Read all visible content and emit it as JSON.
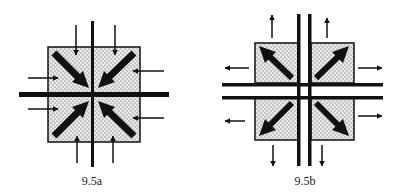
{
  "figures": [
    {
      "id": "a",
      "label": "9.5a",
      "description": "Square block with stippled fill divided by a cross; large diagonal arrows point inward toward center; small arrows on each side point inward (compression)"
    },
    {
      "id": "b",
      "label": "9.5b",
      "description": "Four stippled square blocks separated by double-line channels; large diagonal arrows point outward toward corners; small arrows on each side point outward (tension)"
    }
  ],
  "colors": {
    "ink": "#111111",
    "fill": "#e6e6e6",
    "background": "#ffffff"
  }
}
